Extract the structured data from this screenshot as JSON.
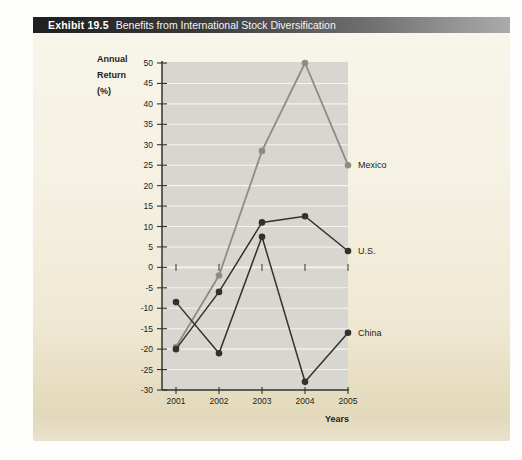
{
  "header": {
    "exhibit_label": "Exhibit 19.5",
    "title": "Benefits from International Stock Diversification"
  },
  "chart_data": {
    "type": "line",
    "title": "Benefits from International Stock Diversification",
    "xlabel": "Years",
    "ylabel": "Annual Return (%)",
    "ylabel_lines": [
      "Annual",
      "Return",
      "(%)"
    ],
    "categories": [
      "2001",
      "2002",
      "2003",
      "2004",
      "2005"
    ],
    "ylim": [
      -30,
      50
    ],
    "ytick_step": 5,
    "grid": true,
    "legend_position": "labels-right-of-last-point",
    "series": [
      {
        "name": "Mexico",
        "color": "#8f8c86",
        "values": [
          -19.5,
          -2,
          28.5,
          50,
          25
        ]
      },
      {
        "name": "U.S.",
        "color": "#33312e",
        "values": [
          -20,
          -6,
          11,
          12.5,
          4
        ]
      },
      {
        "name": "China",
        "color": "#33312e",
        "values": [
          -8.5,
          -21,
          7.5,
          -28,
          -16
        ]
      }
    ],
    "colors": {
      "plot_bg": "#d8d6d0",
      "gridline": "#f5f3ec",
      "axis": "#33322f",
      "label_text": "#1e1d1b",
      "header_bar_left": "#1f1f1f",
      "header_bar_right": "#ababab",
      "panel_top": "#f8f5ea",
      "panel_bottom": "#e3d9ba"
    }
  }
}
